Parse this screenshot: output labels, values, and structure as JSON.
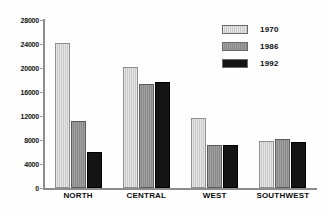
{
  "chart_data": {
    "type": "bar",
    "title": "",
    "xlabel": "",
    "ylabel": "",
    "categories": [
      "NORTH",
      "CENTRAL",
      "WEST",
      "SOUTHWEST"
    ],
    "series": [
      {
        "name": "1970",
        "color": "#c9c9c9",
        "values": [
          24200,
          20100,
          11700,
          7800
        ]
      },
      {
        "name": "1986",
        "color": "#8a8a8a",
        "values": [
          11200,
          17400,
          7200,
          8100
        ]
      },
      {
        "name": "1992",
        "color": "#141414",
        "values": [
          6000,
          17600,
          7150,
          7700
        ]
      }
    ],
    "ylim": [
      0,
      28000
    ],
    "yticks": [
      0,
      4000,
      8000,
      12000,
      16000,
      20000,
      24000,
      28000
    ],
    "ytick_labels": [
      "0",
      "4000",
      "8000",
      "12000",
      "16000",
      "20000",
      "24000",
      "28000"
    ],
    "grid": false,
    "legend_position": "top-right"
  }
}
